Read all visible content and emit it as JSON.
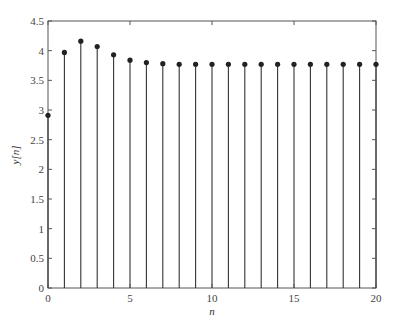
{
  "chart_data": {
    "type": "stem",
    "title": "",
    "xlabel": "n",
    "ylabel": "y[n]",
    "xlim": [
      0,
      20
    ],
    "ylim": [
      0,
      4.5
    ],
    "grid": false,
    "legend": null,
    "x_ticks": [
      0,
      5,
      10,
      15,
      20
    ],
    "x_tick_labels": [
      "0",
      "5",
      "10",
      "15",
      "20"
    ],
    "y_ticks": [
      0,
      0.5,
      1,
      1.5,
      2,
      2.5,
      3,
      3.5,
      4,
      4.5
    ],
    "y_tick_labels": [
      "0",
      "0.5",
      "1",
      "1.5",
      "2",
      "2.5",
      "3",
      "3.5",
      "4",
      "4.5"
    ],
    "x": [
      0,
      1,
      2,
      3,
      4,
      5,
      6,
      7,
      8,
      9,
      10,
      11,
      12,
      13,
      14,
      15,
      16,
      17,
      18,
      19,
      20
    ],
    "values": [
      2.91,
      3.97,
      4.16,
      4.07,
      3.93,
      3.84,
      3.8,
      3.78,
      3.77,
      3.77,
      3.77,
      3.77,
      3.77,
      3.77,
      3.77,
      3.77,
      3.77,
      3.77,
      3.77,
      3.77,
      3.77
    ],
    "colors": {
      "stem": "#333333",
      "marker": "#222222",
      "axis": "#555555",
      "text": "#444444"
    }
  }
}
